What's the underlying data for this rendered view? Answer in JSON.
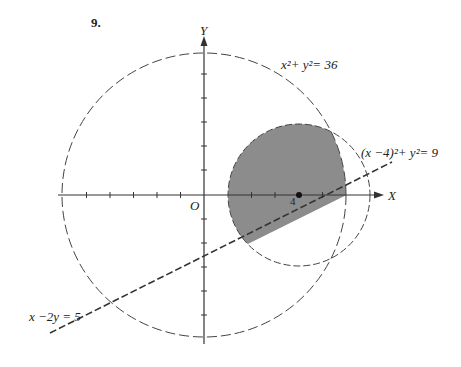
{
  "problem_number": "9.",
  "axes": {
    "x_label": "X",
    "y_label": "Y",
    "origin_label": "O",
    "x_tick_label": "4"
  },
  "curves": {
    "big_circle": {
      "label": "x²+ y²= 36",
      "center": [
        0,
        0
      ],
      "radius": 6
    },
    "small_circle": {
      "label": "(x −4)²+ y²= 9",
      "center": [
        4,
        0
      ],
      "radius": 3
    },
    "line": {
      "label": "x −2y = 5"
    }
  },
  "shading": {
    "color": "#8c8c8c",
    "description": "Region inside both circles and above line x − 2y = 5"
  },
  "colors": {
    "ink": "#333333",
    "shade": "#8c8c8c"
  }
}
